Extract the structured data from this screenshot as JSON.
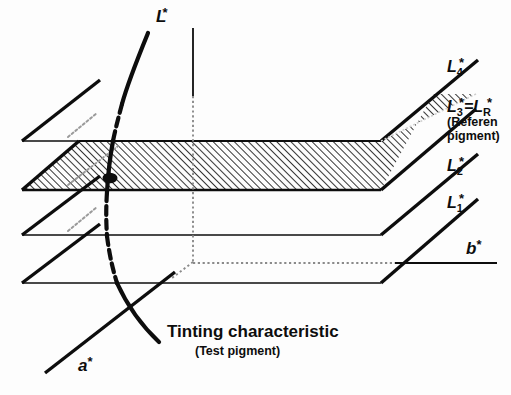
{
  "figure": {
    "caption_main": "Tinting characteristic",
    "caption_sub": "(Test pigment)",
    "background_color": "#fdfdfd",
    "ink_color": "#0d0d0d",
    "hatch_color": "#111111"
  },
  "axes": [
    {
      "id": "L",
      "label": "L",
      "star": "*",
      "name": "lightness-axis"
    },
    {
      "id": "a",
      "label": "a",
      "star": "*",
      "name": "a-axis"
    },
    {
      "id": "b",
      "label": "b",
      "star": "*",
      "name": "b-axis"
    }
  ],
  "planes": [
    {
      "id": "L4",
      "label": "L",
      "subscript": "4",
      "star": "*",
      "hatched": false,
      "note": ""
    },
    {
      "id": "L3",
      "label": "L",
      "subscript": "3",
      "star": "*",
      "equals": "=",
      "label2": "L",
      "subscript2": "R",
      "star2": "*",
      "hatched": true,
      "note_line1": "(Referen",
      "note_line2": "pigment)"
    },
    {
      "id": "L2",
      "label": "L",
      "subscript": "2",
      "star": "*",
      "hatched": false,
      "note": ""
    },
    {
      "id": "L1",
      "label": "L",
      "subscript": "1",
      "star": "*",
      "hatched": false,
      "note": ""
    }
  ],
  "curve": {
    "name": "tinting-characteristic-curve",
    "description": "Tinting characteristic of test pigment crossing the reference plane"
  },
  "marker": {
    "name": "intersection-point",
    "description": "Intersection of the tinting characteristic with the reference plane L3*=LR*"
  }
}
